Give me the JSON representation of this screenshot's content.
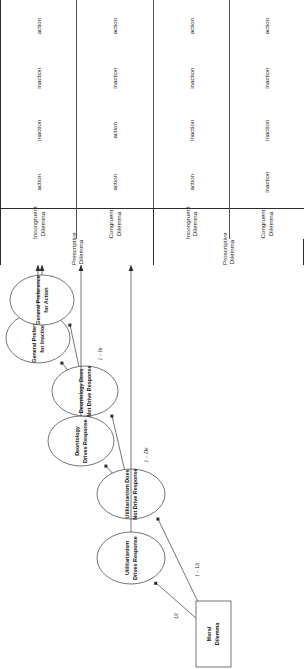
{
  "figure": {
    "type": "multinomial-processing-tree",
    "root": {
      "label_line1": "Moral",
      "label_line2": "Dilemma"
    },
    "nodes": [
      {
        "id": "ut_drives",
        "line1": "Utilitarianism",
        "line2": "Drives Response"
      },
      {
        "id": "ut_not",
        "line1": "Utilitarianism Does",
        "line2": "Not Drive Response"
      },
      {
        "id": "deo_drives",
        "line1": "Deontology",
        "line2": "Drives Response"
      },
      {
        "id": "deo_not",
        "line1": "Deontology Does",
        "line2": "Not Drive Response"
      },
      {
        "id": "pref_inaction",
        "line1": "General Preference",
        "line2": "for Inaction"
      },
      {
        "id": "pref_action",
        "line1": "General Preference",
        "line2": "for Action"
      }
    ],
    "parameters": [
      {
        "id": "Ut",
        "label": "Ut",
        "from": "Moral Dilemma",
        "to": "Utilitarianism Drives Response"
      },
      {
        "id": "oneMinusUt",
        "label": "1 – Ut",
        "from": "Moral Dilemma",
        "to": "Utilitarianism Does Not Drive Response"
      },
      {
        "id": "De",
        "label": "De",
        "from": "Utilitarianism Does Not Drive Response",
        "to": "Deontology Drives Response"
      },
      {
        "id": "oneMinusDe",
        "label": "1 – De",
        "from": "Utilitarianism Does Not Drive Response",
        "to": "Deontology Does Not Drive Response"
      },
      {
        "id": "In",
        "label": "In",
        "from": "Deontology Does Not Drive Response",
        "to": "General Preference for Inaction"
      },
      {
        "id": "oneMinusIn",
        "label": "1 – In",
        "from": "Deontology Does Not Drive Response",
        "to": "General Preference for Action"
      }
    ]
  },
  "table": {
    "column_groups": [
      {
        "id": "prescriptive",
        "label": "Prescriptive Dilemma",
        "subcolumns": [
          {
            "id": "prescriptive_incongruent",
            "line1": "Incongruent",
            "line2": "Dilemma"
          },
          {
            "id": "prescriptive_congruent",
            "line1": "Congruent",
            "line2": "Dilemma"
          }
        ]
      },
      {
        "id": "proscriptive",
        "label": "Proscriptive Dilemma",
        "subcolumns": [
          {
            "id": "proscriptive_incongruent",
            "line1": "Incongruent",
            "line2": "Dilemma"
          },
          {
            "id": "proscriptive_congruent",
            "line1": "Congruent",
            "line2": "Dilemma"
          }
        ]
      }
    ],
    "rows": [
      {
        "id": "row_ut_drives",
        "source_node": "Utilitarianism Drives Response",
        "cells": {
          "prescriptive_incongruent": "action",
          "prescriptive_congruent": "action",
          "proscriptive_incongruent": "action",
          "proscriptive_congruent": "inaction"
        }
      },
      {
        "id": "row_deo_drives",
        "source_node": "Deontology Drives Response",
        "cells": {
          "prescriptive_incongruent": "inaction",
          "prescriptive_congruent": "action",
          "proscriptive_incongruent": "inaction",
          "proscriptive_congruent": "inaction"
        }
      },
      {
        "id": "row_pref_inaction",
        "source_node": "General Preference for Inaction",
        "cells": {
          "prescriptive_incongruent": "inaction",
          "prescriptive_congruent": "inaction",
          "proscriptive_incongruent": "inaction",
          "proscriptive_congruent": "inaction"
        }
      },
      {
        "id": "row_pref_action",
        "source_node": "General Preference for Action",
        "cells": {
          "prescriptive_incongruent": "action",
          "prescriptive_congruent": "action",
          "proscriptive_incongruent": "action",
          "proscriptive_congruent": "action"
        }
      }
    ]
  }
}
